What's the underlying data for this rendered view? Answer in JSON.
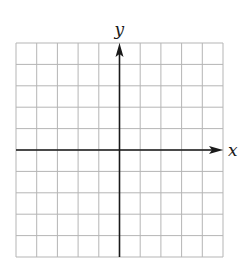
{
  "diagram": {
    "type": "coordinate-grid",
    "grid": {
      "columns": 10,
      "rows": 10,
      "left": 16,
      "top": 43,
      "right": 223,
      "bottom": 257,
      "line_color": "#b5b5b5"
    },
    "axes": {
      "color": "#1a1a1a",
      "origin_col": 5,
      "origin_row": 5,
      "x_label": "x",
      "y_label": "y"
    }
  },
  "chart_data": {
    "type": "grid",
    "title": "",
    "xlabel": "x",
    "ylabel": "y",
    "grid": true,
    "x_range": [
      -5,
      5
    ],
    "y_range": [
      -5,
      5
    ],
    "columns": 10,
    "rows": 10,
    "series": []
  }
}
